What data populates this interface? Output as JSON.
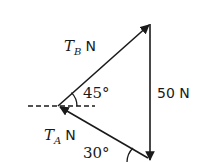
{
  "diagram": {
    "type": "force-triangle",
    "colors": {
      "stroke": "#1a1a1a",
      "background": "#ffffff"
    },
    "vectors": [
      {
        "id": "TB",
        "symbol": "T",
        "subscript": "B",
        "unit": "N",
        "from": "left-vertex",
        "to": "top-vertex"
      },
      {
        "id": "W",
        "label": "50 N",
        "from": "top-vertex",
        "to": "bottom-vertex"
      },
      {
        "id": "TA",
        "symbol": "T",
        "subscript": "A",
        "unit": "N",
        "from": "bottom-vertex",
        "to": "left-vertex"
      }
    ],
    "angles": [
      {
        "label": "45°",
        "at": "left-vertex",
        "between": "TB and horizontal"
      },
      {
        "label": "30°",
        "at": "bottom-vertex",
        "between": "TA and horizontal"
      }
    ],
    "labels": {
      "tb_symbol": "T",
      "tb_sub": "B",
      "tb_unit": "N",
      "ta_symbol": "T",
      "ta_sub": "A",
      "ta_unit": "N",
      "weight": "50 N",
      "angle_45": "45°",
      "angle_30": "30°"
    }
  }
}
